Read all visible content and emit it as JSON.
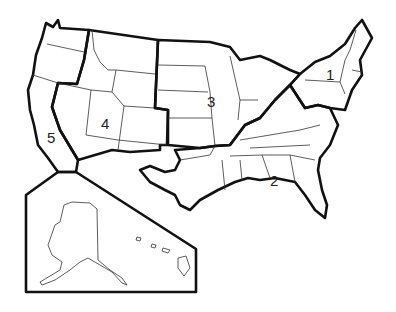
{
  "map": {
    "title": "United States regions map",
    "regions": [
      {
        "id": "1",
        "label": "1",
        "name": "Northeast"
      },
      {
        "id": "2",
        "label": "2",
        "name": "Southeast"
      },
      {
        "id": "3",
        "label": "3",
        "name": "Midwest / Central"
      },
      {
        "id": "4",
        "label": "4",
        "name": "Mountain / Southwest"
      },
      {
        "id": "5",
        "label": "5",
        "name": "Pacific (incl. Alaska & Hawaii)"
      }
    ],
    "inset": {
      "contents": [
        "Alaska",
        "Hawaii"
      ]
    },
    "colors": {
      "line": "#111111",
      "background": "#ffffff"
    }
  }
}
